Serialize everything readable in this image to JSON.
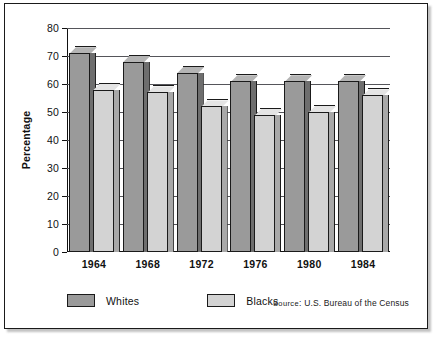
{
  "figure": {
    "y_axis_label": "Percentage",
    "source_prefix": "Source",
    "source_separator": ":",
    "source_text": "U.S. Bureau of the Census"
  },
  "legend": {
    "items": [
      {
        "label": "Whites",
        "swatch": "whites-swatch",
        "color": "#9a9a9a"
      },
      {
        "label": "Blacks",
        "swatch": "blacks-swatch",
        "color": "#d3d3d3"
      }
    ]
  },
  "chart_data": {
    "type": "bar",
    "title": "",
    "subtitle": "",
    "xlabel": "",
    "ylabel": "Percentage",
    "categories": [
      "1964",
      "1968",
      "1972",
      "1976",
      "1980",
      "1984"
    ],
    "series": [
      {
        "name": "Whites",
        "color": "#9a9a9a",
        "values": [
          71,
          68,
          64,
          61,
          61,
          61
        ]
      },
      {
        "name": "Blacks",
        "color": "#d3d3d3",
        "values": [
          58,
          57,
          52,
          49,
          50,
          56
        ]
      }
    ],
    "ylim": [
      0,
      80
    ],
    "yticks": [
      0,
      10,
      20,
      30,
      40,
      50,
      60,
      70,
      80
    ],
    "ytick_labels": [
      "0",
      "10",
      "20",
      "30",
      "40",
      "50",
      "60",
      "70",
      "80"
    ],
    "grid": true,
    "grid_axis": "y",
    "legend_position": "bottom-left",
    "style": "3d-bar",
    "annotations": [
      "Source: U.S. Bureau of the Census"
    ]
  }
}
